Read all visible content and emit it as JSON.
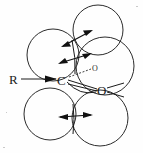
{
  "figure": {
    "type": "chemical-structure-diagram",
    "background_color": "#fefefe",
    "stroke_color": "#2b2b2b",
    "width": 143,
    "height": 153
  },
  "labels": {
    "substituent": "R",
    "carbon": "C",
    "oxygen": "O",
    "lone_pair_oxygen": "O"
  },
  "atoms": [
    {
      "id": "substituent-r",
      "label": "R",
      "x": 13,
      "y": 80
    },
    {
      "id": "carbon-center",
      "label": "C",
      "x": 61,
      "y": 80
    },
    {
      "id": "oxygen-carbonyl",
      "label": "O",
      "x": 101,
      "y": 90
    },
    {
      "id": "oxygen-lone-pair",
      "label": "O",
      "x": 95,
      "y": 69
    }
  ],
  "spheres": [
    {
      "id": "sphere-upper-left",
      "cx": 53,
      "cy": 55,
      "r": 26
    },
    {
      "id": "sphere-top-right",
      "cx": 98,
      "cy": 30,
      "r": 25
    },
    {
      "id": "sphere-mid-right",
      "cx": 105,
      "cy": 66,
      "r": 29
    },
    {
      "id": "sphere-lower-left",
      "cx": 50,
      "cy": 114,
      "r": 26
    },
    {
      "id": "sphere-lower-right",
      "cx": 100,
      "cy": 118,
      "r": 28
    }
  ],
  "bonds": [
    {
      "id": "bond-r-to-c",
      "type": "single-line",
      "from": "substituent-r",
      "to": "carbon-center"
    },
    {
      "id": "bond-c-to-o-upper",
      "type": "solid",
      "from": "carbon-center",
      "to": "oxygen-carbonyl"
    },
    {
      "id": "bond-c-to-o-lower",
      "type": "solid",
      "from": "carbon-center",
      "to": "oxygen-carbonyl"
    },
    {
      "id": "bond-c-to-lone-pair",
      "type": "dashed",
      "from": "carbon-center",
      "to": "oxygen-lone-pair"
    }
  ],
  "motion_arrows": [
    {
      "id": "arrow-upper",
      "direction": "diagonal-up-right",
      "x1": 67,
      "y1": 45,
      "x2": 92,
      "y2": 31
    },
    {
      "id": "arrow-middle",
      "direction": "diagonal-up-right",
      "x1": 63,
      "y1": 62,
      "x2": 90,
      "y2": 54
    },
    {
      "id": "arrow-lower",
      "direction": "horizontal",
      "x1": 62,
      "y1": 117,
      "x2": 92,
      "y2": 115
    }
  ],
  "legend": {
    "description": "Double-headed arrows indicate directions of atomic displacement"
  }
}
